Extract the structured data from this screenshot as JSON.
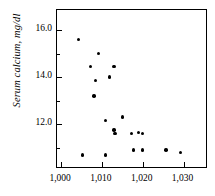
{
  "chart_data": {
    "type": "scatter",
    "title": "",
    "xlabel": "",
    "ylabel": "Serum calcium, mg/dl",
    "xlim": [
      999,
      1036
    ],
    "ylim": [
      10.1,
      16.85
    ],
    "grid": false,
    "legend": null,
    "marker": "filled-circle",
    "marker_color": "#000000",
    "x_tick_labels": [
      "1,000",
      "1,010",
      "1,020",
      "1,030"
    ],
    "x_ticks": [
      1000,
      1010,
      1020,
      1030
    ],
    "y_tick_labels": [
      "16.0",
      "14.0",
      "12.0"
    ],
    "y_ticks": [
      16.0,
      14.0,
      12.0
    ],
    "y_minor_ticks": [
      17.0,
      15.0,
      13.0,
      11.0
    ],
    "points": [
      {
        "x": 1004.3,
        "y": 15.6
      },
      {
        "x": 1009.1,
        "y": 15.0
      },
      {
        "x": 1007.2,
        "y": 14.45
      },
      {
        "x": 1013.0,
        "y": 14.45
      },
      {
        "x": 1008.5,
        "y": 13.85
      },
      {
        "x": 1011.8,
        "y": 14.0
      },
      {
        "x": 1008.1,
        "y": 13.2
      },
      {
        "x": 1010.9,
        "y": 12.15
      },
      {
        "x": 1015.1,
        "y": 12.3
      },
      {
        "x": 1013.0,
        "y": 11.75
      },
      {
        "x": 1013.2,
        "y": 11.6
      },
      {
        "x": 1017.2,
        "y": 11.6
      },
      {
        "x": 1019.0,
        "y": 11.65
      },
      {
        "x": 1020.0,
        "y": 11.6
      },
      {
        "x": 1017.8,
        "y": 10.9
      },
      {
        "x": 1019.9,
        "y": 10.9
      },
      {
        "x": 1025.7,
        "y": 10.9
      },
      {
        "x": 1029.2,
        "y": 10.8
      },
      {
        "x": 1005.3,
        "y": 10.7
      },
      {
        "x": 1010.9,
        "y": 10.7
      }
    ]
  }
}
